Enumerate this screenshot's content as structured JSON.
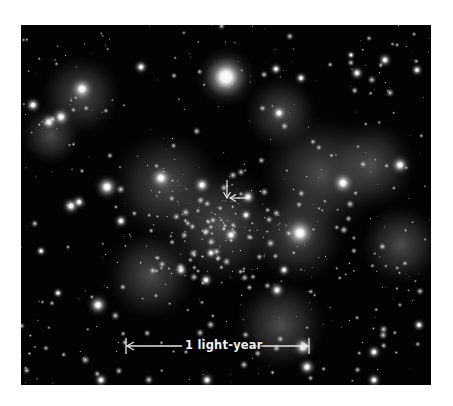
{
  "image": {
    "subject": "star cluster field (astronomical photograph)",
    "background_color": "#030303",
    "star_color": "#ffffff",
    "annotation_color": "#e8e8e8"
  },
  "scale_bar": {
    "label": "1 light-year"
  },
  "marker": {
    "icon_down": "arrow-down-icon",
    "icon_left": "arrow-left-icon"
  }
}
